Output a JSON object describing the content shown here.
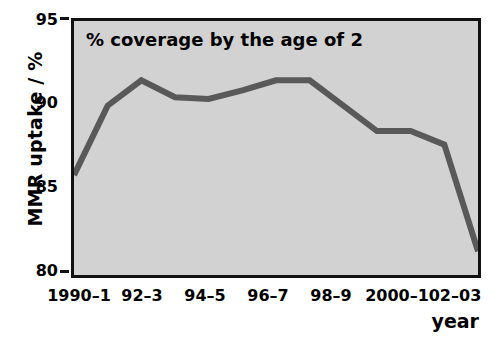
{
  "chart_data": {
    "type": "line",
    "title": "% coverage by the age of 2",
    "xlabel": "year",
    "ylabel": "MMR uptake / %",
    "ylim": [
      80,
      95
    ],
    "yticks": [
      80,
      85,
      90,
      95
    ],
    "grid": false,
    "legend": null,
    "line_color": "#595959",
    "plot_background": "#d2d2d2",
    "categories": [
      "1990–1",
      "91–2",
      "92–3",
      "93–4",
      "94–5",
      "95–6",
      "96–7",
      "97–8",
      "98–9",
      "99–2000",
      "2000–1",
      "01–02",
      "02–03"
    ],
    "x_tick_labels": [
      "1990–1",
      "92–3",
      "94–5",
      "96–7",
      "98–9",
      "2000–1",
      "02–03"
    ],
    "values": [
      85.9,
      90.0,
      91.5,
      90.5,
      90.4,
      90.9,
      91.5,
      91.5,
      90.0,
      88.5,
      88.5,
      87.7,
      81.4
    ],
    "series": [
      {
        "name": "MMR uptake",
        "values": [
          85.9,
          90.0,
          91.5,
          90.5,
          90.4,
          90.9,
          91.5,
          91.5,
          90.0,
          88.5,
          88.5,
          87.7,
          81.4
        ]
      }
    ]
  },
  "axes": {
    "y_label": "MMR uptake / %",
    "y_tick_0": "80",
    "y_tick_1": "85",
    "y_tick_2": "90",
    "y_tick_3": "95",
    "x_label": "year",
    "x_tick_0": "1990–1",
    "x_tick_1": "92–3",
    "x_tick_2": "94–5",
    "x_tick_3": "96–7",
    "x_tick_4": "98–9",
    "x_tick_5": "2000–1",
    "x_tick_6": "02–03"
  },
  "plot_title": "% coverage by the age of 2"
}
